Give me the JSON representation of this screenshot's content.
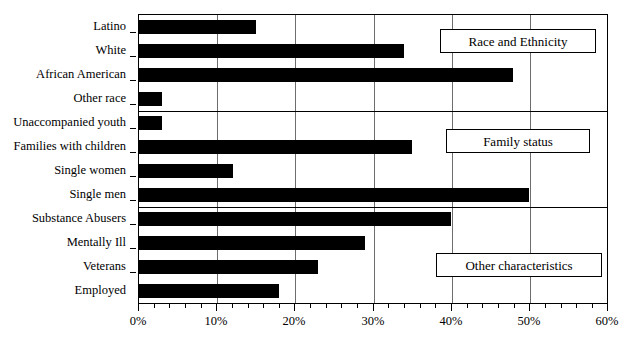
{
  "chart_data": {
    "type": "bar",
    "orientation": "horizontal",
    "title": "",
    "xlabel": "",
    "ylabel": "",
    "xlim": [
      0,
      60
    ],
    "xunit": "%",
    "grid": true,
    "legend": "none",
    "xticks": [
      "0%",
      "10%",
      "20%",
      "30%",
      "40%",
      "50%",
      "60%"
    ],
    "xtick_values": [
      0,
      10,
      20,
      30,
      40,
      50,
      60
    ],
    "categories": [
      "Latino",
      "White",
      "African American",
      "Other race",
      "Unaccompanied youth",
      "Families with children",
      "Single women",
      "Single men",
      "Substance Abusers",
      "Mentally Ill",
      "Veterans",
      "Employed"
    ],
    "values": [
      15,
      34,
      48,
      3,
      3,
      35,
      12,
      50,
      40,
      29,
      23,
      18
    ],
    "bar_color": "#000000",
    "groups": [
      {
        "label": "Race and Ethnicity",
        "categories": [
          "Latino",
          "White",
          "African American",
          "Other race"
        ]
      },
      {
        "label": "Family status",
        "categories": [
          "Unaccompanied youth",
          "Families with children",
          "Single women",
          "Single men"
        ]
      },
      {
        "label": "Other characteristics",
        "categories": [
          "Substance Abusers",
          "Mentally Ill",
          "Veterans",
          "Employed"
        ]
      }
    ],
    "annotations": [
      {
        "text": "Race and Ethnicity",
        "x": 38,
        "y": "Latino-White"
      },
      {
        "text": "Family status",
        "x": 38,
        "y": "Unaccompanied youth-Families with children"
      },
      {
        "text": "Other characteristics",
        "x": 38,
        "y": "Veterans-Employed"
      }
    ]
  },
  "annotation_boxes": {
    "race": "Race and Ethnicity",
    "family": "Family status",
    "other": "Other characteristics"
  }
}
